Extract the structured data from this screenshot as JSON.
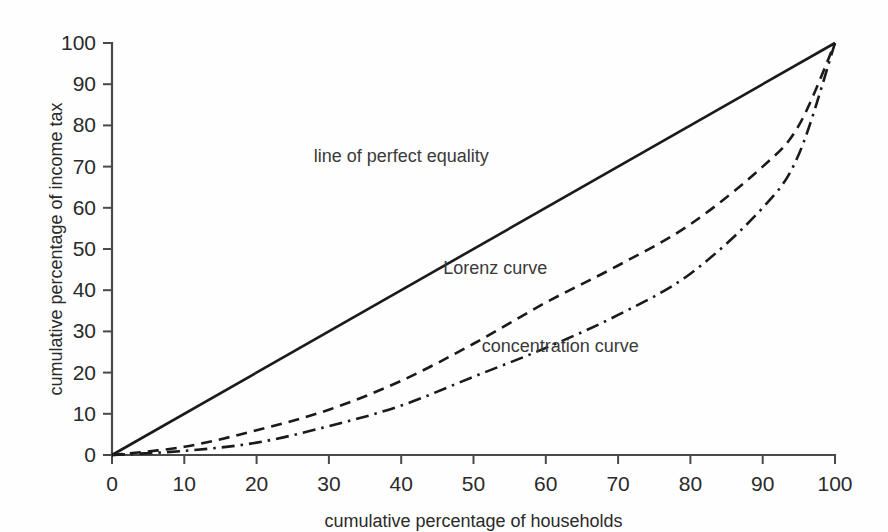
{
  "chart_data": {
    "type": "line",
    "title": "",
    "xlabel": "cumulative percentage of households",
    "ylabel": "cumulative percentage of income tax",
    "xlim": [
      0,
      100
    ],
    "ylim": [
      0,
      100
    ],
    "xticks": [
      0,
      10,
      20,
      30,
      40,
      50,
      60,
      70,
      80,
      90,
      100
    ],
    "yticks": [
      0,
      10,
      20,
      30,
      40,
      50,
      60,
      70,
      80,
      90,
      100
    ],
    "xtick_labels": [
      "0",
      "10",
      "20",
      "30",
      "40",
      "50",
      "60",
      "70",
      "80",
      "90",
      "100"
    ],
    "ytick_labels": [
      "0",
      "10",
      "20",
      "30",
      "40",
      "50",
      "60",
      "70",
      "80",
      "90",
      "100"
    ],
    "grid": false,
    "legend_position": "inline-annotations",
    "x": [
      0,
      10,
      20,
      30,
      40,
      50,
      60,
      70,
      80,
      90,
      95,
      100
    ],
    "series": [
      {
        "name": "line of perfect equality",
        "style": "solid",
        "color": "#1a1a1a",
        "values": [
          0,
          10,
          20,
          30,
          40,
          50,
          60,
          70,
          80,
          90,
          95,
          100
        ]
      },
      {
        "name": "Lorenz curve",
        "style": "dashed",
        "color": "#1a1a1a",
        "values": [
          0,
          2,
          6,
          11,
          18,
          27,
          37,
          46,
          56,
          70,
          80,
          100
        ]
      },
      {
        "name": "concentration curve",
        "style": "dash-dot",
        "color": "#1a1a1a",
        "values": [
          0,
          1,
          3,
          7,
          12,
          19,
          26,
          34,
          44,
          60,
          73,
          100
        ]
      }
    ],
    "annotations": [
      {
        "text": "line of perfect equality",
        "x": 40,
        "y": 71
      },
      {
        "text": "Lorenz curve",
        "x": 53,
        "y": 44
      },
      {
        "text": "concentration curve",
        "x": 62,
        "y": 25
      }
    ]
  },
  "axes": {
    "x_title": "cumulative percentage of households",
    "y_title": "cumulative percentage of income tax"
  }
}
